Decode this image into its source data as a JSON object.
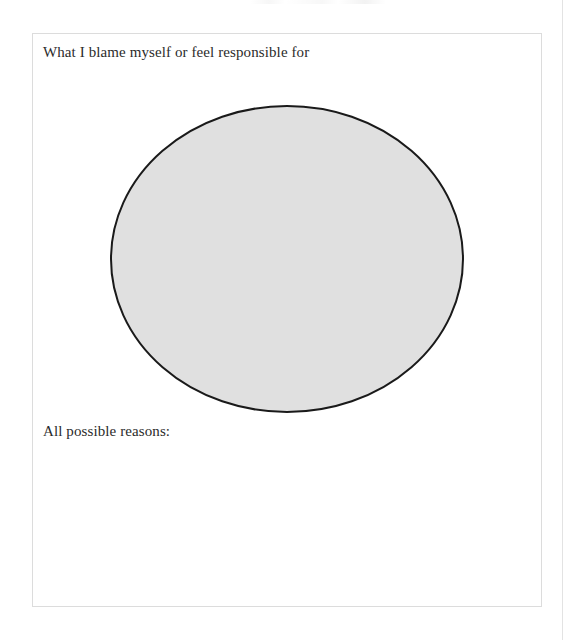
{
  "page": {
    "background_color": "#ffffff",
    "width": 572,
    "height": 640
  },
  "worksheet": {
    "card": {
      "border_color": "#dcdcdc",
      "background_color": "#ffffff"
    },
    "prompt_heading": "What I blame myself or feel responsible for",
    "oval": {
      "fill_color": "#e0e0e0",
      "stroke_color": "#1a1a1a",
      "stroke_width": 2,
      "center_x": 178,
      "center_y": 155,
      "radius_x": 176,
      "radius_y": 153
    },
    "reasons_label": "All possible reasons:",
    "answer_area_value": "",
    "answer_area_placeholder": ""
  }
}
